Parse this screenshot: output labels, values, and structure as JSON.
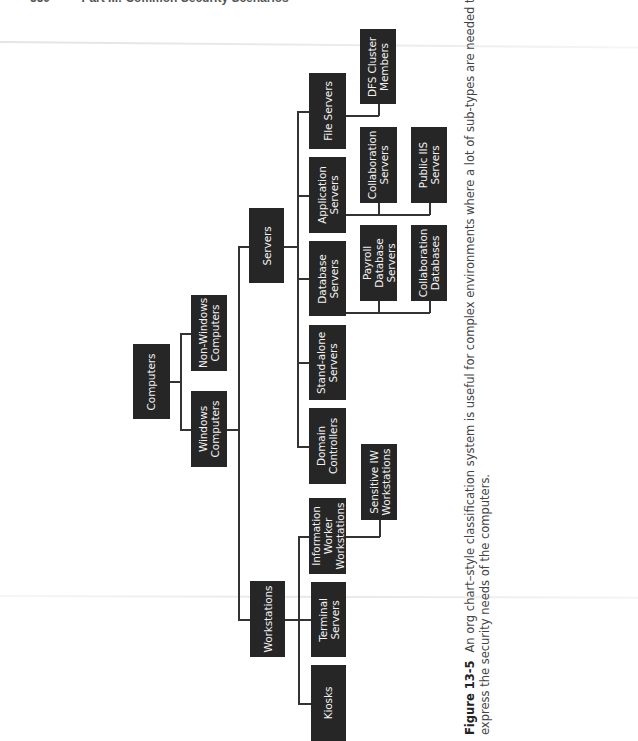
{
  "header": {
    "page_number": "550",
    "part_title": "Part III:   Common Security Scenarios"
  },
  "diagram": {
    "root": "Computers",
    "nodes": {
      "computers": "Computers",
      "non_windows": "Non-Windows\nComputers",
      "windows": "Windows\nComputers",
      "servers": "Servers",
      "workstations": "Workstations",
      "file_servers": "File Servers",
      "application_servers": "Application\nServers",
      "database_servers": "Database\nServers",
      "standalone_servers": "Stand-alone\nServers",
      "domain_controllers": "Domain\nControllers",
      "dfs_cluster": "DFS Cluster\nMembers",
      "collab_servers": "Collaboration\nServers",
      "public_iis": "Public IIS\nServers",
      "payroll_db": "Payroll\nDatabase\nServers",
      "collab_db": "Collaboration\nDatabases",
      "iw_workstations": "Information\nWorker\nWorkstations",
      "terminal_servers": "Terminal\nServers",
      "kiosks": "Kiosks",
      "sensitive_iw": "Sensitive IW\nWorkstations"
    },
    "hierarchy": {
      "Computers": [
        "Non-Windows Computers",
        "Windows Computers"
      ],
      "Windows Computers": [
        "Servers",
        "Workstations"
      ],
      "Servers": [
        "File Servers",
        "Application Servers",
        "Database Servers",
        "Stand-alone Servers",
        "Domain Controllers"
      ],
      "File Servers": [
        "DFS Cluster Members"
      ],
      "Application Servers": [
        "Collaboration Servers",
        "Public IIS Servers"
      ],
      "Database Servers": [
        "Payroll Database Servers",
        "Collaboration Databases"
      ],
      "Workstations": [
        "Information Worker Workstations",
        "Terminal Servers",
        "Kiosks"
      ],
      "Information Worker Workstations": [
        "Sensitive IW Workstations"
      ]
    },
    "colors": {
      "box_fill": "#262626",
      "box_text": "#f2f2f2",
      "connector": "#333333"
    }
  },
  "caption": {
    "figure_label": "Figure 13-5",
    "line1": "An org chart–style classification system is useful for complex environments where a lot of sub-types are needed to adequately",
    "line2": "express the security needs of the computers."
  }
}
